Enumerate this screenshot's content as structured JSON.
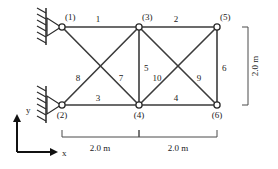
{
  "figure": {
    "type": "truss-diagram",
    "units": "m",
    "stroke_color": "#3b3b3b",
    "background": "#ffffff"
  },
  "nodes": [
    {
      "id": "1",
      "label": "(1)",
      "x": 0.0,
      "y": 2.0,
      "px": 62,
      "py": 27,
      "lx": 65,
      "ly": 20
    },
    {
      "id": "2",
      "label": "(2)",
      "x": 0.0,
      "y": 0.0,
      "px": 62,
      "py": 105,
      "lx": 62,
      "ly": 117
    },
    {
      "id": "3",
      "label": "(3)",
      "x": 2.0,
      "y": 2.0,
      "px": 139,
      "py": 27,
      "lx": 142,
      "ly": 20
    },
    {
      "id": "4",
      "label": "(4)",
      "x": 2.0,
      "y": 0.0,
      "px": 139,
      "py": 105,
      "lx": 139,
      "ly": 117
    },
    {
      "id": "5",
      "label": "(5)",
      "x": 4.0,
      "y": 2.0,
      "px": 217,
      "py": 27,
      "lx": 220,
      "ly": 20
    },
    {
      "id": "6",
      "label": "(6)",
      "x": 4.0,
      "y": 0.0,
      "px": 217,
      "py": 105,
      "lx": 217,
      "ly": 117
    }
  ],
  "members": [
    {
      "id": "1",
      "label": "1",
      "from": "1",
      "to": "3",
      "lx": 98,
      "ly": 22
    },
    {
      "id": "2",
      "label": "2",
      "from": "3",
      "to": "5",
      "lx": 176,
      "ly": 22
    },
    {
      "id": "3",
      "label": "3",
      "from": "2",
      "to": "4",
      "lx": 98,
      "ly": 101
    },
    {
      "id": "4",
      "label": "4",
      "from": "4",
      "to": "6",
      "lx": 176,
      "ly": 101
    },
    {
      "id": "5",
      "label": "5",
      "from": "3",
      "to": "4",
      "lx": 143,
      "ly": 70
    },
    {
      "id": "6",
      "label": "6",
      "from": "5",
      "to": "6",
      "lx": 221,
      "ly": 70
    },
    {
      "id": "7",
      "label": "7",
      "from": "1",
      "to": "4",
      "lx": 121,
      "ly": 78
    },
    {
      "id": "8",
      "label": "8",
      "from": "2",
      "to": "3",
      "lx": 78,
      "ly": 78
    },
    {
      "id": "9",
      "label": "9",
      "from": "3",
      "to": "6",
      "lx": 198,
      "ly": 78
    },
    {
      "id": "10",
      "label": "10",
      "from": "4",
      "to": "5",
      "lx": 155,
      "ly": 78
    }
  ],
  "supports": [
    {
      "node": "1",
      "type": "pin",
      "name": "support-node-1"
    },
    {
      "node": "2",
      "type": "pin",
      "name": "support-node-2"
    }
  ],
  "dimensions": [
    {
      "id": "bottom-left",
      "label": "2.0 m",
      "orientation": "horizontal",
      "from_px": 62,
      "to_px": 139,
      "y_px": 136,
      "lx": 100,
      "ly": 150
    },
    {
      "id": "bottom-right",
      "label": "2.0 m",
      "orientation": "horizontal",
      "from_px": 139,
      "to_px": 217,
      "y_px": 136,
      "lx": 178,
      "ly": 150
    },
    {
      "id": "right-height",
      "label": "2.0 m",
      "orientation": "vertical",
      "from_px": 27,
      "to_px": 105,
      "x_px": 247,
      "lx": 255,
      "ly": 66
    }
  ],
  "axes": {
    "x_label": "x",
    "y_label": "y",
    "origin_px": {
      "x": 17,
      "y": 152
    },
    "x_tip_px": {
      "x": 52,
      "y": 152
    },
    "y_tip_px": {
      "x": 17,
      "y": 116
    },
    "x_label_px": {
      "x": 58,
      "y": 155
    },
    "y_label_px": {
      "x": 25,
      "y": 112
    }
  }
}
